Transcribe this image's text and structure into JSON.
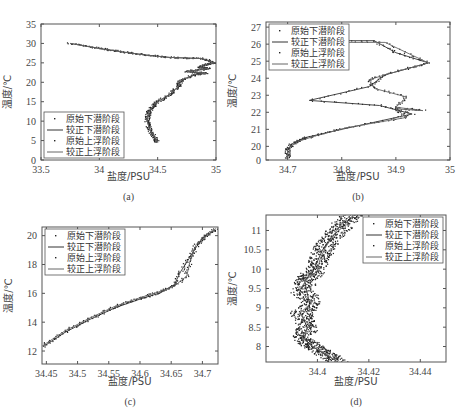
{
  "chart_data": [
    {
      "type": "line",
      "caption": "(a)",
      "xlabel": "盐度/PSU",
      "ylabel": "温度/℃",
      "xlim": [
        33.5,
        35
      ],
      "ylim": [
        0,
        35
      ],
      "xticks": [
        33.5,
        34,
        34.5,
        35
      ],
      "xtick_labels": [
        "33.5",
        "34",
        "34.5",
        "35"
      ],
      "yticks": [
        0,
        5,
        10,
        15,
        20,
        25,
        30,
        35
      ],
      "ytick_labels": [
        "0",
        "5",
        "10",
        "15",
        "20",
        "25",
        "30",
        "35"
      ],
      "legend": [
        "原始下潜阶段",
        "较正下潜阶段",
        "原始上浮阶段",
        "较正上浮阶段"
      ],
      "legend_position": "bottom-left",
      "series": [
        {
          "name": "较正下潜阶段",
          "x": [
            33.75,
            34.0,
            34.2,
            34.4,
            34.6,
            34.88,
            34.99,
            34.9,
            34.86,
            34.94,
            34.75,
            34.92,
            34.82,
            34.7,
            34.68,
            34.6,
            34.5,
            34.45,
            34.42,
            34.41,
            34.43,
            34.47,
            34.5
          ],
          "y": [
            30,
            28.7,
            27.8,
            27,
            26.4,
            26.1,
            25,
            24.5,
            23.8,
            23.5,
            22.8,
            22.3,
            22,
            20.5,
            19,
            16.8,
            15,
            13.5,
            12,
            10,
            8,
            6,
            4.5
          ]
        },
        {
          "name": "较正上浮阶段",
          "x": [
            33.75,
            34.0,
            34.2,
            34.4,
            34.6,
            34.88,
            34.99,
            34.9,
            34.86,
            34.94,
            34.75,
            34.92,
            34.82,
            34.7,
            34.68,
            34.6,
            34.5,
            34.45,
            34.42,
            34.41,
            34.43,
            34.47,
            34.5
          ],
          "y": [
            30,
            28.7,
            27.8,
            27,
            26.4,
            26.1,
            25,
            24.5,
            23.8,
            23.5,
            22.8,
            22.3,
            22,
            20.5,
            19,
            16.8,
            15,
            13.5,
            12,
            10,
            8,
            6,
            4.5
          ]
        }
      ]
    },
    {
      "type": "line",
      "caption": "(b)",
      "xlabel": "盐度/PSU",
      "ylabel": "温度/℃",
      "xlim": [
        34.66,
        35
      ],
      "ylim": [
        19.2,
        27.3
      ],
      "xticks": [
        34.7,
        34.8,
        34.9,
        35
      ],
      "xtick_labels": [
        "34.7",
        "34.8",
        "34.9",
        "35"
      ],
      "yticks": [
        19.2,
        20,
        21,
        22,
        23,
        24,
        25,
        26,
        27
      ],
      "ytick_labels": [
        "0",
        "20",
        "21",
        "22",
        "23",
        "24",
        "25",
        "26",
        "27"
      ],
      "legend": [
        "原始下潜阶段",
        "较正下潜阶段",
        "原始上浮阶段",
        "较正上浮阶段"
      ],
      "legend_position": "top-left",
      "series": [
        {
          "name": "较正下潜阶段",
          "x": [
            34.7,
            34.7,
            34.71,
            34.73,
            34.8,
            34.93,
            34.87,
            34.74,
            34.85,
            34.88,
            34.96,
            34.9,
            34.86,
            34.7
          ],
          "y": [
            19.3,
            19.8,
            20.2,
            20.5,
            21.0,
            21.9,
            22.4,
            22.7,
            23.5,
            24.2,
            24.9,
            25.5,
            26.2,
            26.2
          ]
        },
        {
          "name": "较正上浮阶段",
          "x": [
            34.7,
            34.7,
            34.72,
            34.75,
            34.81,
            34.92,
            34.9,
            34.95,
            34.9,
            34.92,
            34.86,
            34.85,
            34.88,
            34.96,
            34.88,
            34.7
          ],
          "y": [
            19.3,
            19.9,
            20.3,
            20.6,
            21.1,
            21.7,
            22.2,
            22.1,
            22.3,
            22.9,
            23.4,
            23.9,
            24.2,
            24.9,
            26.1,
            26.1
          ]
        }
      ]
    },
    {
      "type": "line",
      "caption": "(c)",
      "xlabel": "盐度/PSU",
      "ylabel": "温度/℃",
      "xlim": [
        34.443,
        34.725
      ],
      "ylim": [
        11.1,
        20.6
      ],
      "xticks": [
        34.45,
        34.5,
        34.55,
        34.6,
        34.65,
        34.7
      ],
      "xtick_labels": [
        "34.45",
        "34.5",
        "34.55",
        "34.6",
        "34.65",
        "34.7"
      ],
      "yticks": [
        12,
        14,
        16,
        18,
        20
      ],
      "ytick_labels": [
        "12",
        "14",
        "16",
        "18",
        "20"
      ],
      "legend": [
        "原始下潜阶段",
        "较正下潜阶段",
        "原始上浮阶段",
        "较正上浮阶段"
      ],
      "legend_position": "top-left",
      "series": [
        {
          "name": "较正下潜阶段",
          "x": [
            34.445,
            34.48,
            34.52,
            34.56,
            34.6,
            34.63,
            34.655,
            34.665,
            34.68,
            34.69,
            34.7,
            34.72
          ],
          "y": [
            12.3,
            13.3,
            14.2,
            15.0,
            15.6,
            16.0,
            16.6,
            17.5,
            18.5,
            19.2,
            19.8,
            20.4
          ]
        },
        {
          "name": "较正上浮阶段",
          "x": [
            34.445,
            34.48,
            34.52,
            34.56,
            34.6,
            34.63,
            34.655,
            34.675,
            34.68,
            34.69,
            34.71,
            34.722
          ],
          "y": [
            12.4,
            13.4,
            14.3,
            15.1,
            15.7,
            16.1,
            16.5,
            17.2,
            18.2,
            19.4,
            20.1,
            20.5
          ]
        }
      ]
    },
    {
      "type": "line",
      "caption": "(d)",
      "xlabel": "盐度/PSU",
      "ylabel": "温度/℃",
      "xlim": [
        34.38,
        34.45
      ],
      "ylim": [
        7.6,
        11.4
      ],
      "xticks": [
        34.4,
        34.42,
        34.44
      ],
      "xtick_labels": [
        "34.4",
        "34.42",
        "34.44"
      ],
      "yticks": [
        8,
        8.5,
        9,
        9.5,
        10,
        10.5,
        11
      ],
      "ytick_labels": [
        "8",
        "8.5",
        "9",
        "9.5",
        "10",
        "10.5",
        "11"
      ],
      "legend": [
        "原始下潜阶段",
        "较正下潜阶段",
        "原始上浮阶段",
        "较正上浮阶段"
      ],
      "legend_position": "top-right",
      "series": [
        {
          "name": "较正下潜阶段",
          "x": [
            34.408,
            34.403,
            34.398,
            34.395,
            34.396,
            34.394,
            34.397,
            34.396,
            34.395,
            34.398,
            34.4,
            34.402,
            34.405,
            34.41,
            34.414
          ],
          "y": [
            7.6,
            7.8,
            8.0,
            8.2,
            8.5,
            8.8,
            9.1,
            9.4,
            9.7,
            9.9,
            10.2,
            10.5,
            10.8,
            11.1,
            11.4
          ]
        },
        {
          "name": "较正上浮阶段",
          "x": [
            34.407,
            34.402,
            34.397,
            34.394,
            34.397,
            34.393,
            34.398,
            34.393,
            34.396,
            34.4,
            34.401,
            34.403,
            34.406,
            34.409,
            34.413
          ],
          "y": [
            7.65,
            7.85,
            8.05,
            8.25,
            8.55,
            8.85,
            9.15,
            9.45,
            9.75,
            9.95,
            10.25,
            10.55,
            10.85,
            11.15,
            11.4
          ]
        }
      ]
    }
  ],
  "figure": {
    "bottom_caption_partial": ""
  }
}
